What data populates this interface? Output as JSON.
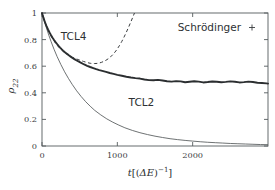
{
  "chart_data": {
    "type": "line",
    "title": "",
    "xlabel": "t[(ΔE)⁻¹]",
    "ylabel": "ρ₂₂",
    "xlim": [
      0,
      3000
    ],
    "ylim": [
      0,
      1
    ],
    "xticks": [
      0,
      1000,
      2000
    ],
    "xticklabels": [
      "0",
      "1000",
      "2000"
    ],
    "yticks": [
      0,
      0.2,
      0.4,
      0.6,
      0.8,
      1
    ],
    "yticklabels": [
      "0",
      "0.2",
      "0.4",
      "0.6",
      "0.8",
      "1"
    ],
    "grid": false,
    "legend": {
      "position": "top-right",
      "entries": [
        {
          "label": "Schrödinger",
          "marker": "plus",
          "style": "noisy-thick-line",
          "color": "#2b2e30"
        }
      ]
    },
    "annotations": [
      {
        "text": "TCL4",
        "x": 420,
        "y": 0.8
      },
      {
        "text": "TCL2",
        "x": 1320,
        "y": 0.3
      }
    ],
    "series": [
      {
        "name": "Schrödinger",
        "style": "solid-thick-noisy",
        "color": "#2b2e30",
        "x": [
          0,
          20,
          40,
          60,
          80,
          100,
          120,
          140,
          160,
          180,
          200,
          220,
          240,
          260,
          280,
          300,
          320,
          340,
          360,
          380,
          400,
          430,
          460,
          490,
          520,
          560,
          600,
          640,
          680,
          720,
          760,
          800,
          850,
          900,
          950,
          1000,
          1060,
          1120,
          1180,
          1240,
          1300,
          1360,
          1420,
          1480,
          1540,
          1600,
          1660,
          1720,
          1780,
          1840,
          1900,
          1960,
          2020,
          2080,
          2140,
          2200,
          2260,
          2320,
          2380,
          2440,
          2500,
          2560,
          2620,
          2680,
          2740,
          2800,
          2860,
          2920,
          2980,
          3000
        ],
        "y": [
          1.0,
          0.963,
          0.929,
          0.901,
          0.876,
          0.854,
          0.833,
          0.814,
          0.797,
          0.781,
          0.767,
          0.753,
          0.74,
          0.728,
          0.717,
          0.707,
          0.698,
          0.689,
          0.68,
          0.672,
          0.664,
          0.653,
          0.643,
          0.634,
          0.625,
          0.613,
          0.603,
          0.594,
          0.586,
          0.578,
          0.571,
          0.565,
          0.557,
          0.549,
          0.542,
          0.535,
          0.528,
          0.521,
          0.515,
          0.51,
          0.507,
          0.5,
          0.495,
          0.494,
          0.497,
          0.492,
          0.487,
          0.484,
          0.488,
          0.486,
          0.479,
          0.483,
          0.487,
          0.484,
          0.478,
          0.481,
          0.485,
          0.483,
          0.479,
          0.482,
          0.486,
          0.483,
          0.478,
          0.48,
          0.484,
          0.481,
          0.476,
          0.474,
          0.471,
          0.469
        ]
      },
      {
        "name": "TCL4",
        "style": "dashed",
        "color": "#3a3d3f",
        "x": [
          0,
          25,
          50,
          75,
          100,
          130,
          160,
          190,
          220,
          250,
          280,
          310,
          340,
          370,
          400,
          430,
          460,
          490,
          520,
          550,
          580,
          610,
          640,
          670,
          700,
          730,
          760,
          790,
          820,
          850,
          880,
          910,
          940,
          970,
          1000,
          1030,
          1060,
          1090,
          1120,
          1150,
          1180,
          1210,
          1240,
          1270,
          1300,
          1330,
          1360
        ],
        "y": [
          1.0,
          0.955,
          0.915,
          0.88,
          0.849,
          0.817,
          0.79,
          0.766,
          0.745,
          0.727,
          0.711,
          0.698,
          0.686,
          0.676,
          0.668,
          0.661,
          0.654,
          0.648,
          0.642,
          0.636,
          0.631,
          0.626,
          0.622,
          0.62,
          0.62,
          0.621,
          0.624,
          0.629,
          0.636,
          0.645,
          0.656,
          0.67,
          0.687,
          0.707,
          0.73,
          0.757,
          0.787,
          0.82,
          0.856,
          0.894,
          0.934,
          0.975,
          1.018,
          1.062,
          1.108,
          1.155,
          1.2
        ]
      },
      {
        "name": "TCL2",
        "style": "solid-thin",
        "color": "#54585a",
        "x": [
          0,
          30,
          60,
          90,
          120,
          160,
          200,
          250,
          300,
          350,
          400,
          460,
          520,
          580,
          640,
          700,
          780,
          860,
          940,
          1020,
          1100,
          1200,
          1300,
          1400,
          1500,
          1600,
          1700,
          1800,
          1900,
          2000,
          2100,
          2200,
          2300,
          2400,
          2500,
          2600,
          2700,
          2800,
          2900,
          3000
        ],
        "y": [
          1.0,
          0.941,
          0.886,
          0.834,
          0.786,
          0.727,
          0.673,
          0.613,
          0.558,
          0.509,
          0.464,
          0.415,
          0.372,
          0.333,
          0.299,
          0.268,
          0.234,
          0.204,
          0.179,
          0.157,
          0.137,
          0.117,
          0.1,
          0.086,
          0.074,
          0.064,
          0.055,
          0.048,
          0.042,
          0.037,
          0.032,
          0.028,
          0.025,
          0.022,
          0.019,
          0.017,
          0.015,
          0.013,
          0.011,
          0.01
        ]
      }
    ]
  }
}
